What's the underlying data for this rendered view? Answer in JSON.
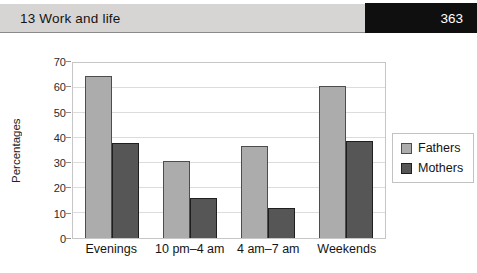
{
  "header": {
    "title": "13 Work and life",
    "page_number": "363"
  },
  "chart_data": {
    "type": "bar",
    "title": "",
    "categories": [
      "Evenings",
      "10 pm–4 am",
      "4 am–7 am",
      "Weekends"
    ],
    "series": [
      {
        "name": "Fathers",
        "values": [
          65,
          31,
          37,
          61
        ],
        "color": "#acacac",
        "border_color": "#4d4d4d"
      },
      {
        "name": "Mothers",
        "values": [
          38,
          16,
          12,
          39
        ],
        "color": "#565656",
        "border_color": "#1f1f1f"
      }
    ],
    "xlabel": "",
    "ylabel": "Percentages",
    "ylim": [
      0,
      70
    ],
    "yticks": [
      0,
      10,
      20,
      30,
      40,
      50,
      60,
      70
    ],
    "grid": true,
    "legend_position": "right"
  },
  "colors": {
    "header_band": "#d6d5d3",
    "header_rule": "#8a8a8a",
    "page_box": "#0f0f0f",
    "page_text": "#ffffff",
    "plot_border": "#c6c6c6",
    "gridline": "#dcdcdc"
  }
}
